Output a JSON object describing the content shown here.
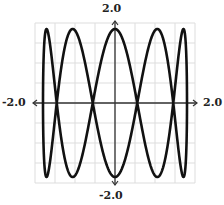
{
  "chart_data": {
    "type": "line",
    "title": "",
    "parametric": {
      "x": "1.8*sin(t)",
      "y": "1.85*cos(5*t)",
      "t_range": [
        0,
        6.2832
      ],
      "x_amplitude": 1.8,
      "y_amplitude": 1.85,
      "x_frequency": 1,
      "y_frequency": 5
    },
    "xlabel": "",
    "ylabel": "",
    "xlim": [
      -2.0,
      2.0
    ],
    "ylim": [
      -2.0,
      2.0
    ],
    "grid": true,
    "grid_step": 0.5,
    "axis_labels": {
      "x_min": "-2.0",
      "x_max": "2.0",
      "y_min": "-2.0",
      "y_max": "2.0"
    },
    "colors": {
      "curve": "#111111",
      "axis": "#333333",
      "grid": "#dddddd"
    }
  }
}
